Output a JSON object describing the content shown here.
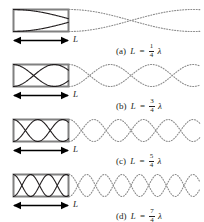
{
  "figure": {
    "background_color": "#ffffff",
    "tube_color": "#808080",
    "wave_solid_color": "#231f20",
    "wave_dotted_color": "#8c8c8c",
    "arrow_color": "#000000",
    "length_label": "L"
  },
  "panels": [
    {
      "id": "a",
      "tag": "(a)",
      "length_label": "L",
      "equals": "=",
      "numerator": "1",
      "denominator": "4",
      "lambda": "λ",
      "relation_text": "L = 1/4 λ",
      "quarter_wavelengths_in_tube": 1,
      "harmonic": 1,
      "lobes_in_tube": 0.5,
      "wavelength_px": 248,
      "amplitude_px": 11,
      "tube_left_px": 13,
      "tube_right_px": 69,
      "tube_top_px": 9,
      "tube_bottom_px": 32
    },
    {
      "id": "b",
      "tag": "(b)",
      "length_label": "L",
      "equals": "=",
      "numerator": "3",
      "denominator": "4",
      "lambda": "λ",
      "relation_text": "L = 3/4 λ",
      "quarter_wavelengths_in_tube": 3,
      "harmonic": 3,
      "lobes_in_tube": 1.5,
      "wavelength_px": 82.7,
      "amplitude_px": 11,
      "tube_left_px": 13,
      "tube_right_px": 69,
      "tube_top_px": 9,
      "tube_bottom_px": 32
    },
    {
      "id": "c",
      "tag": "(c)",
      "length_label": "L",
      "equals": "=",
      "numerator": "5",
      "denominator": "4",
      "lambda": "λ",
      "relation_text": "L = 5/4 λ",
      "quarter_wavelengths_in_tube": 5,
      "harmonic": 5,
      "lobes_in_tube": 2.5,
      "wavelength_px": 49.6,
      "amplitude_px": 11,
      "tube_left_px": 13,
      "tube_right_px": 69,
      "tube_top_px": 9,
      "tube_bottom_px": 32
    },
    {
      "id": "d",
      "tag": "(d)",
      "length_label": "L",
      "equals": "=",
      "numerator": "7",
      "denominator": "4",
      "lambda": "λ",
      "relation_text": "L = 7/4 λ",
      "quarter_wavelengths_in_tube": 7,
      "harmonic": 7,
      "lobes_in_tube": 3.5,
      "wavelength_px": 35.4,
      "amplitude_px": 11,
      "tube_left_px": 13,
      "tube_right_px": 69,
      "tube_top_px": 9,
      "tube_bottom_px": 32
    }
  ],
  "chart_data": {
    "type": "line",
    "xlabel": "",
    "ylabel": "",
    "series": [
      {
        "name": "(a) L = 1/4 λ",
        "harmonic": 1,
        "wavelength_in_tube_lengths": 4,
        "nodes_in_tube": 1,
        "antinodes_in_tube": 1
      },
      {
        "name": "(b) L = 3/4 λ",
        "harmonic": 3,
        "wavelength_in_tube_lengths": 1.3333,
        "nodes_in_tube": 2,
        "antinodes_in_tube": 2
      },
      {
        "name": "(c) L = 5/4 λ",
        "harmonic": 5,
        "wavelength_in_tube_lengths": 0.8,
        "nodes_in_tube": 3,
        "antinodes_in_tube": 3
      },
      {
        "name": "(d) L = 7/4 λ",
        "harmonic": 7,
        "wavelength_in_tube_lengths": 0.5714,
        "nodes_in_tube": 4,
        "antinodes_in_tube": 4
      }
    ]
  }
}
